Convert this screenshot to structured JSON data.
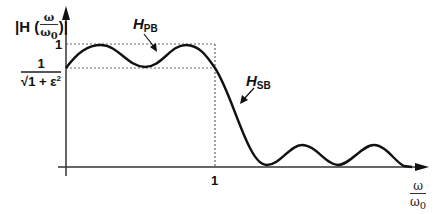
{
  "diagram": {
    "type": "lowpass-filter-magnitude-response",
    "y_axis": {
      "label_prefix": "|H (",
      "label_num": "ω",
      "label_den": "ω",
      "label_den_sub": "0",
      "label_suffix": ")|"
    },
    "x_axis": {
      "label_num": "ω",
      "label_den": "ω",
      "label_den_sub": "0",
      "tick_1": "1"
    },
    "y_ticks": {
      "one": "1",
      "ripple_num": "1",
      "ripple_den": "√1 + ε",
      "ripple_den_sup": "2"
    },
    "annotations": {
      "passband": {
        "main": "H",
        "sub": "PB"
      },
      "stopband": {
        "main": "H",
        "sub": "SB"
      }
    },
    "colors": {
      "curve": "#111111",
      "axis": "#333333",
      "dashed": "#666666"
    }
  }
}
